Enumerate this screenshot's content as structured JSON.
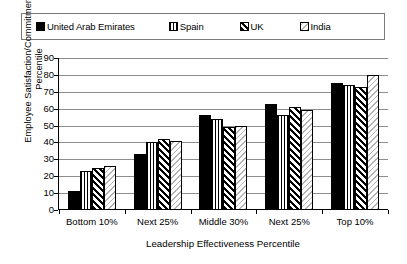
{
  "chart_data": {
    "type": "bar",
    "title": "",
    "xlabel": "Leadership Effectiveness Percentile",
    "ylabel": "Employee Satisfaction/Commitment Percentile",
    "ylabel_lines": [
      "Employee Satisfaction/Commitment",
      "Percentile"
    ],
    "categories": [
      "Bottom 10%",
      "Next 25%",
      "Middle 30%",
      "Next 25%",
      "Top 10%"
    ],
    "series": [
      {
        "name": "United Arab Emirates",
        "pattern": "solid-black",
        "values": [
          11,
          33,
          56,
          63,
          75
        ]
      },
      {
        "name": "Spain",
        "pattern": "vertical-stripes",
        "values": [
          23,
          40,
          54,
          56,
          74
        ]
      },
      {
        "name": "UK",
        "pattern": "diagonal-hatch",
        "values": [
          25,
          42,
          49,
          61,
          73
        ]
      },
      {
        "name": "India",
        "pattern": "light-diagonal",
        "values": [
          26,
          41,
          50,
          59,
          80
        ]
      }
    ],
    "ylim": [
      0,
      90
    ],
    "yticks": [
      0,
      10,
      20,
      30,
      40,
      50,
      60,
      70,
      80,
      90
    ],
    "ytick_labels": [
      "0",
      "10",
      "20",
      "30",
      "40",
      "50",
      "60",
      "70",
      "80",
      "90"
    ],
    "grid": true,
    "grid_axis": "y",
    "legend_position": "top"
  },
  "legend": {
    "items": [
      {
        "label": "United Arab Emirates",
        "pattern": "solid-black"
      },
      {
        "label": "Spain",
        "pattern": "vertical-stripes"
      },
      {
        "label": "UK",
        "pattern": "diagonal-hatch"
      },
      {
        "label": "India",
        "pattern": "light-diagonal"
      }
    ]
  },
  "colors": {
    "series_black": "#000000",
    "grid": "#8d8d8d",
    "axis": "#000000",
    "legend_border": "#7b7b7b",
    "light_pattern": "#b4b4b4",
    "background": "#ffffff"
  }
}
